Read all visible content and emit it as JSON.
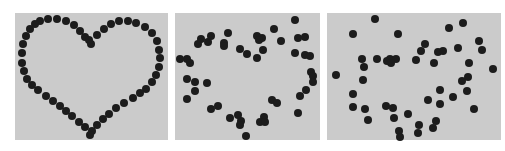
{
  "figure": {
    "caption": "",
    "background": "#ffffff",
    "panel_color": "#cbcbcb",
    "dot_color": "#1c1c1c",
    "panels": [
      {
        "name": "heart-shape-panel",
        "x": 15,
        "y": 13,
        "w": 153,
        "h": 127,
        "dots": [
          [
            40,
            21
          ],
          [
            48,
            19
          ],
          [
            57,
            19
          ],
          [
            66,
            21
          ],
          [
            74,
            25
          ],
          [
            80,
            31
          ],
          [
            85,
            37
          ],
          [
            89,
            40
          ],
          [
            91,
            44
          ],
          [
            97,
            35
          ],
          [
            104,
            29
          ],
          [
            111,
            24
          ],
          [
            119,
            21
          ],
          [
            128,
            21
          ],
          [
            136,
            23
          ],
          [
            145,
            27
          ],
          [
            152,
            33
          ],
          [
            157,
            41
          ],
          [
            159,
            50
          ],
          [
            160,
            58
          ],
          [
            159,
            67
          ],
          [
            156,
            75
          ],
          [
            152,
            82
          ],
          [
            146,
            89
          ],
          [
            140,
            93
          ],
          [
            133,
            98
          ],
          [
            124,
            103
          ],
          [
            116,
            108
          ],
          [
            109,
            114
          ],
          [
            103,
            119
          ],
          [
            97,
            125
          ],
          [
            92,
            131
          ],
          [
            90,
            135
          ],
          [
            85,
            127
          ],
          [
            79,
            122
          ],
          [
            72,
            116
          ],
          [
            66,
            111
          ],
          [
            60,
            106
          ],
          [
            53,
            101
          ],
          [
            46,
            96
          ],
          [
            38,
            90
          ],
          [
            32,
            85
          ],
          [
            27,
            79
          ],
          [
            24,
            71
          ],
          [
            22,
            63
          ],
          [
            22,
            53
          ],
          [
            23,
            44
          ],
          [
            26,
            36
          ],
          [
            30,
            29
          ],
          [
            35,
            24
          ]
        ]
      },
      {
        "name": "scattered-heart-panel",
        "x": 175,
        "y": 13,
        "w": 145,
        "h": 127,
        "dots": [
          [
            180,
            59
          ],
          [
            187,
            59
          ],
          [
            190,
            63
          ],
          [
            198,
            44
          ],
          [
            201,
            39
          ],
          [
            208,
            42
          ],
          [
            211,
            36
          ],
          [
            224,
            43
          ],
          [
            224,
            46
          ],
          [
            228,
            33
          ],
          [
            240,
            49
          ],
          [
            247,
            54
          ],
          [
            257,
            36
          ],
          [
            262,
            38
          ],
          [
            259,
            40
          ],
          [
            263,
            50
          ],
          [
            257,
            58
          ],
          [
            274,
            29
          ],
          [
            281,
            41
          ],
          [
            295,
            20
          ],
          [
            298,
            38
          ],
          [
            305,
            37
          ],
          [
            295,
            53
          ],
          [
            305,
            55
          ],
          [
            310,
            56
          ],
          [
            311,
            72
          ],
          [
            313,
            76
          ],
          [
            313,
            82
          ],
          [
            306,
            90
          ],
          [
            300,
            96
          ],
          [
            298,
            113
          ],
          [
            272,
            100
          ],
          [
            277,
            103
          ],
          [
            264,
            117
          ],
          [
            260,
            122
          ],
          [
            265,
            122
          ],
          [
            246,
            136
          ],
          [
            238,
            115
          ],
          [
            241,
            121
          ],
          [
            240,
            125
          ],
          [
            230,
            118
          ],
          [
            218,
            106
          ],
          [
            211,
            109
          ],
          [
            207,
            83
          ],
          [
            195,
            82
          ],
          [
            187,
            79
          ],
          [
            195,
            91
          ],
          [
            187,
            99
          ]
        ]
      },
      {
        "name": "random-scatter-panel",
        "x": 327,
        "y": 13,
        "w": 174,
        "h": 127,
        "dots": [
          [
            375,
            19
          ],
          [
            353,
            34
          ],
          [
            398,
            34
          ],
          [
            449,
            28
          ],
          [
            463,
            23
          ],
          [
            479,
            41
          ],
          [
            482,
            50
          ],
          [
            425,
            44
          ],
          [
            421,
            51
          ],
          [
            438,
            52
          ],
          [
            443,
            51
          ],
          [
            458,
            48
          ],
          [
            362,
            59
          ],
          [
            377,
            59
          ],
          [
            387,
            61
          ],
          [
            390,
            59
          ],
          [
            396,
            59
          ],
          [
            391,
            63
          ],
          [
            416,
            60
          ],
          [
            434,
            63
          ],
          [
            469,
            63
          ],
          [
            493,
            69
          ],
          [
            364,
            67
          ],
          [
            363,
            80
          ],
          [
            336,
            75
          ],
          [
            468,
            77
          ],
          [
            462,
            81
          ],
          [
            467,
            91
          ],
          [
            440,
            90
          ],
          [
            453,
            97
          ],
          [
            428,
            100
          ],
          [
            440,
            104
          ],
          [
            474,
            109
          ],
          [
            353,
            94
          ],
          [
            353,
            107
          ],
          [
            365,
            109
          ],
          [
            368,
            120
          ],
          [
            386,
            106
          ],
          [
            393,
            108
          ],
          [
            394,
            118
          ],
          [
            408,
            114
          ],
          [
            419,
            125
          ],
          [
            436,
            121
          ],
          [
            433,
            128
          ],
          [
            418,
            133
          ],
          [
            399,
            131
          ],
          [
            400,
            137
          ]
        ]
      }
    ]
  }
}
